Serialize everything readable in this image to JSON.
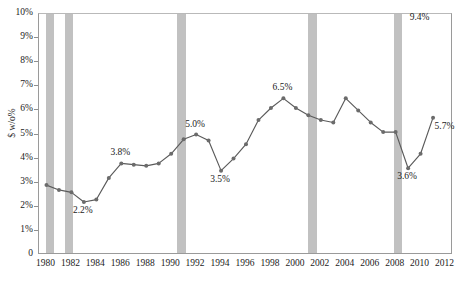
{
  "chart_data": {
    "type": "line",
    "title": "",
    "subtitle": "",
    "xlabel": "",
    "ylabel": "$ w/o%",
    "xlim": [
      1979.4,
      2012.6
    ],
    "ylim": [
      0,
      10
    ],
    "grid": false,
    "legend_position": "none",
    "y_tick_labels": [
      "10%",
      "9%",
      "8%",
      "7%",
      "6%",
      "5%",
      "4%",
      "3%",
      "2%",
      "1%",
      "0"
    ],
    "y_tick_values": [
      10,
      9,
      8,
      7,
      6,
      5,
      4,
      3,
      2,
      1,
      0
    ],
    "x_tick_labels": [
      "1980",
      "1982",
      "1984",
      "1986",
      "1988",
      "1990",
      "1992",
      "1994",
      "1996",
      "1998",
      "2000",
      "2002",
      "2004",
      "2006",
      "2008",
      "2010",
      "2012"
    ],
    "x_tick_values": [
      1980,
      1982,
      1984,
      1986,
      1988,
      1990,
      1992,
      1994,
      1996,
      1998,
      2000,
      2002,
      2004,
      2006,
      2008,
      2010,
      2012
    ],
    "series": [
      {
        "name": "$ w/o%",
        "x": [
          1980,
          1981,
          1982,
          1983,
          1984,
          1985,
          1986,
          1987,
          1988,
          1989,
          1990,
          1991,
          1992,
          1993,
          1994,
          1995,
          1996,
          1997,
          1998,
          1999,
          2000,
          2001,
          2002,
          2003,
          2004,
          2005,
          2006,
          2007,
          2008,
          2009,
          2010,
          2011
        ],
        "values": [
          2.9,
          2.7,
          2.6,
          2.2,
          2.3,
          3.2,
          3.8,
          3.75,
          3.7,
          3.8,
          4.2,
          4.8,
          5.0,
          4.75,
          3.5,
          4.0,
          4.6,
          5.6,
          6.1,
          6.5,
          6.1,
          5.8,
          5.6,
          5.5,
          6.5,
          6.0,
          5.5,
          5.1,
          5.1,
          3.6,
          4.2,
          5.7
        ]
      }
    ],
    "point_annotations": [
      {
        "label": "2.2%",
        "x": 1983,
        "value": 2.2,
        "position": "below"
      },
      {
        "label": "3.8%",
        "x": 1986,
        "value": 3.8,
        "position": "above"
      },
      {
        "label": "5.0%",
        "x": 1992,
        "value": 5.0,
        "position": "above"
      },
      {
        "label": "3.5%",
        "x": 1994,
        "value": 3.5,
        "position": "below"
      },
      {
        "label": "6.5%",
        "x": 1999,
        "value": 6.5,
        "position": "above"
      },
      {
        "label": "3.6%",
        "x": 2009,
        "value": 3.6,
        "position": "below"
      },
      {
        "label": "9.4%",
        "x": 2010,
        "value": 9.4,
        "position": "above"
      },
      {
        "label": "5.7%",
        "x": 2012,
        "value": 5.7,
        "position": "below"
      }
    ],
    "recession_bands": [
      {
        "name": "recession-1980",
        "start": 1980.0,
        "end": 1980.6
      },
      {
        "name": "recession-1981-1982",
        "start": 1981.5,
        "end": 1982.15
      },
      {
        "name": "recession-1990-1991",
        "start": 1990.5,
        "end": 1991.2
      },
      {
        "name": "recession-2001",
        "start": 2001.0,
        "end": 2001.7
      },
      {
        "name": "recession-2007-2009",
        "start": 2007.9,
        "end": 2008.5
      }
    ],
    "colors": {
      "line": "#5a5a5a",
      "marker": "#6b6b6b",
      "recession_band": "#b6b6b6",
      "axis": "#9a9a9a",
      "text": "#1b1b1b",
      "background": "#ffffff"
    }
  }
}
